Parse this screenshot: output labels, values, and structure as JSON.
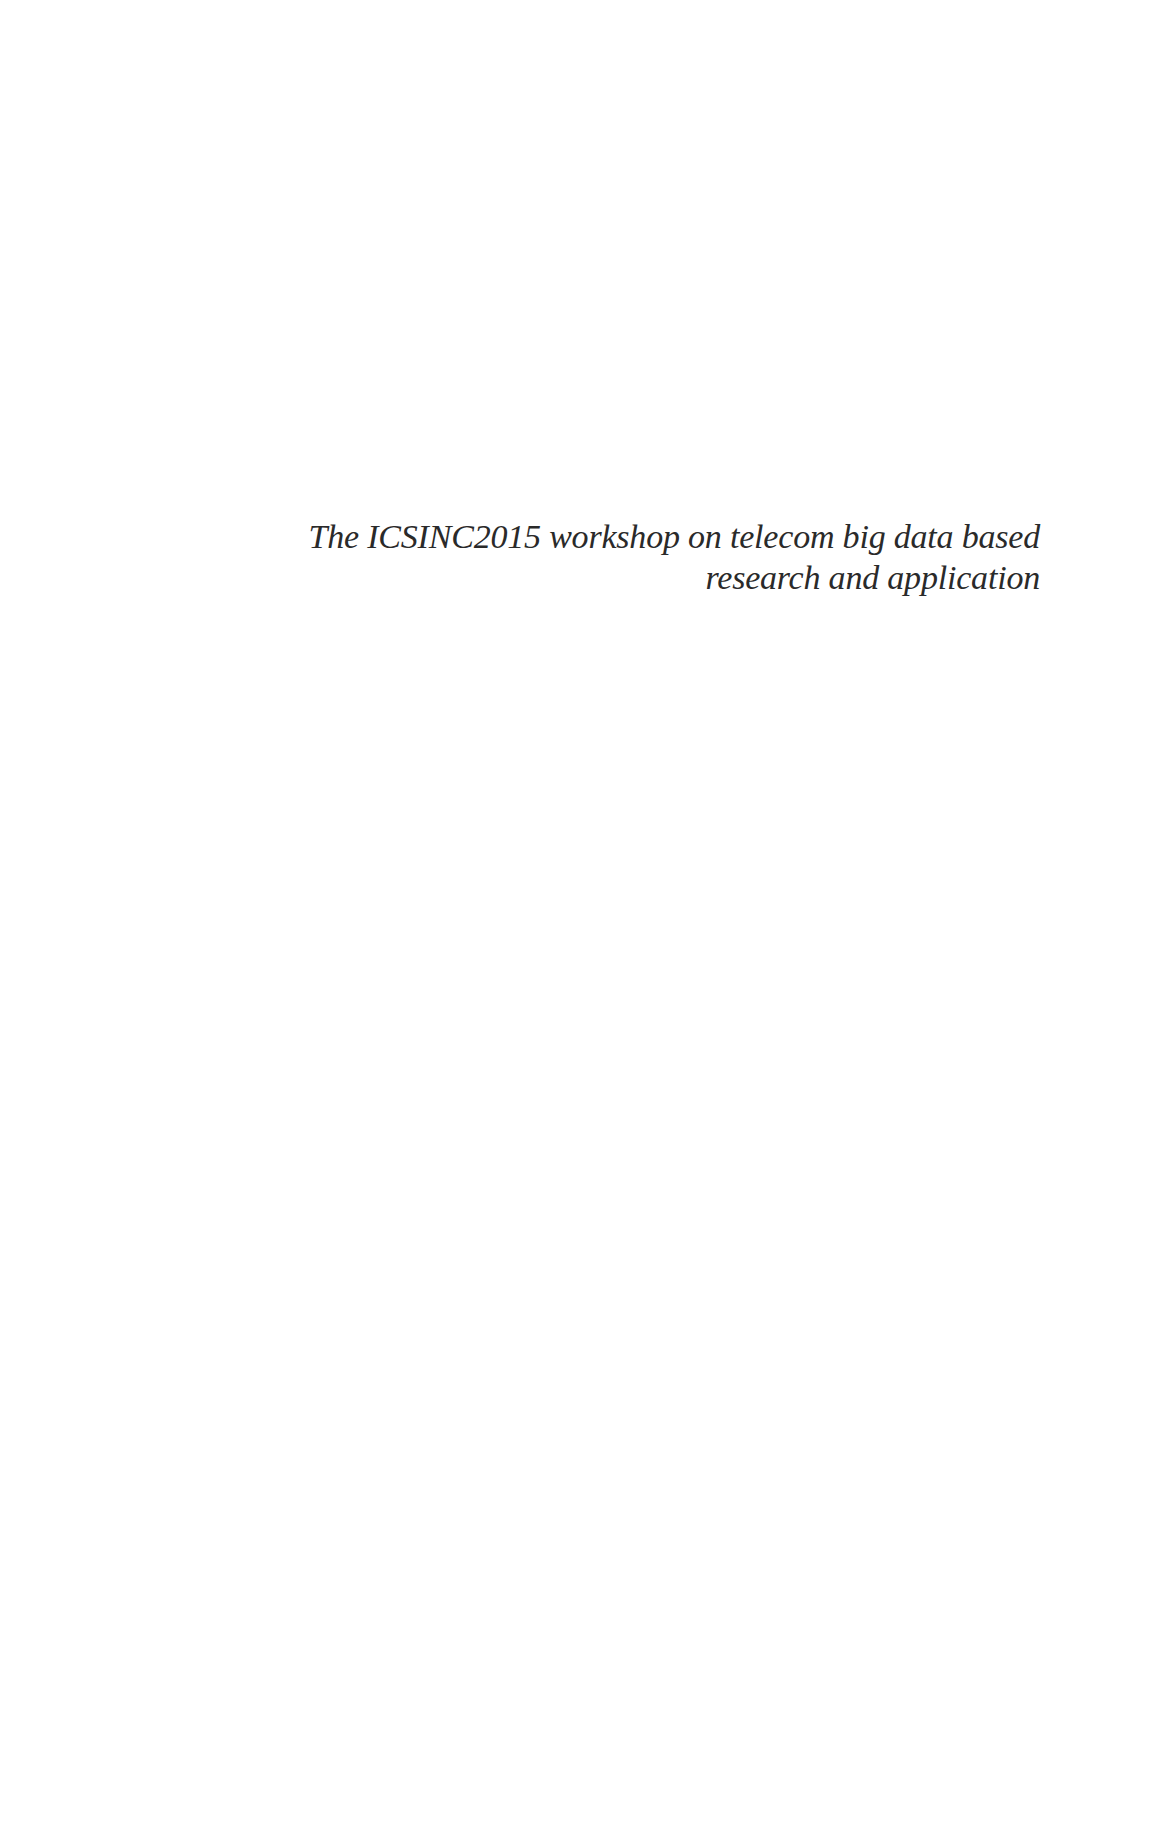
{
  "page": {
    "title_lines": [
      "The ICSINC2015 workshop on telecom big data based",
      "research and application"
    ]
  }
}
